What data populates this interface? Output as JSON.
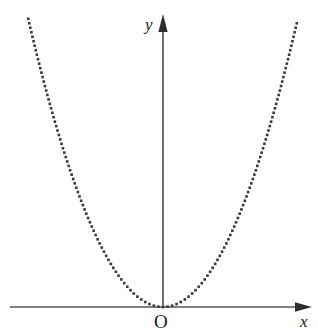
{
  "figure": {
    "background_color": "#ffffff",
    "width": 318,
    "height": 336
  },
  "labels": {
    "x_axis": "x",
    "y_axis": "y",
    "origin": "O"
  },
  "chart_data": {
    "type": "line",
    "title": "",
    "subtitle": "",
    "xlabel": "x",
    "ylabel": "y",
    "curve_label": "",
    "legend": [],
    "legend_position": "none",
    "grid": false,
    "annotations": [
      "O"
    ],
    "line_style": "dotted",
    "marker": "square",
    "marker_size_px": 2.6,
    "marker_spacing_px": 4.6,
    "curve_color": "#3a3a3a",
    "axis_color": "#585858",
    "axis": {
      "origin_px": {
        "x": 163,
        "y": 307
      },
      "x_axis_start_px": 10,
      "x_axis_end_px": 312,
      "y_axis_top_px": 14,
      "y_axis_bottom_px": 307,
      "x_arrow": "right",
      "y_arrow": "up",
      "ticks": [],
      "tick_labels": []
    },
    "function": "y = a*x^2",
    "coefficient_a_px": 0.01586,
    "vertex": {
      "x": 0,
      "y": 0
    },
    "opens": "up",
    "symmetry_axis": "y-axis",
    "x_domain_px": [
      -135,
      134
    ],
    "y_range_px": [
      0,
      289
    ],
    "x": [
      -135,
      -126,
      -117,
      -108,
      -99,
      -90,
      -81,
      -72,
      -63,
      -54,
      -45,
      -36,
      -27,
      -18,
      -9,
      0,
      9,
      18,
      27,
      36,
      45,
      54,
      63,
      72,
      81,
      90,
      99,
      108,
      117,
      126,
      134
    ],
    "values": [
      289.0,
      251.8,
      217.1,
      185.0,
      155.4,
      128.5,
      104.1,
      82.2,
      62.9,
      46.2,
      32.1,
      20.6,
      11.6,
      5.1,
      1.3,
      0.0,
      1.3,
      5.1,
      11.6,
      20.6,
      32.1,
      46.2,
      62.9,
      82.2,
      104.1,
      128.5,
      155.4,
      185.0,
      217.1,
      251.8,
      285.0
    ]
  }
}
